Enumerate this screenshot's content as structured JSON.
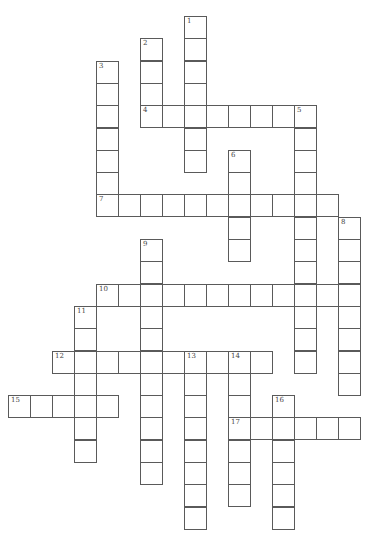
{
  "puzzle": {
    "type": "crossword",
    "cell_size": 22,
    "origin": {
      "x": 8,
      "y": 16
    },
    "row_step": 22.3,
    "line_color": "#5a5a5a",
    "background": "#ffffff",
    "entries": [
      {
        "number": "1",
        "direction": "down",
        "row": 0,
        "col": 8,
        "length": 7
      },
      {
        "number": "2",
        "direction": "down",
        "row": 1,
        "col": 6,
        "length": 4
      },
      {
        "number": "3",
        "direction": "down",
        "row": 2,
        "col": 4,
        "length": 7
      },
      {
        "number": "4",
        "direction": "across",
        "row": 4,
        "col": 6,
        "length": 8
      },
      {
        "number": "5",
        "direction": "down",
        "row": 4,
        "col": 13,
        "length": 12
      },
      {
        "number": "6",
        "direction": "down",
        "row": 6,
        "col": 10,
        "length": 5
      },
      {
        "number": "7",
        "direction": "across",
        "row": 8,
        "col": 4,
        "length": 11
      },
      {
        "number": "8",
        "direction": "down",
        "row": 9,
        "col": 15,
        "length": 8
      },
      {
        "number": "9",
        "direction": "down",
        "row": 10,
        "col": 6,
        "length": 11
      },
      {
        "number": "10",
        "direction": "across",
        "row": 12,
        "col": 4,
        "length": 12
      },
      {
        "number": "11",
        "direction": "down",
        "row": 13,
        "col": 3,
        "length": 7
      },
      {
        "number": "12",
        "direction": "across",
        "row": 15,
        "col": 2,
        "length": 10
      },
      {
        "number": "13",
        "direction": "down",
        "row": 15,
        "col": 8,
        "length": 8
      },
      {
        "number": "14",
        "direction": "down",
        "row": 15,
        "col": 10,
        "length": 7
      },
      {
        "number": "15",
        "direction": "across",
        "row": 17,
        "col": 0,
        "length": 5
      },
      {
        "number": "16",
        "direction": "down",
        "row": 17,
        "col": 12,
        "length": 6
      },
      {
        "number": "17",
        "direction": "across",
        "row": 18,
        "col": 10,
        "length": 6
      }
    ]
  }
}
